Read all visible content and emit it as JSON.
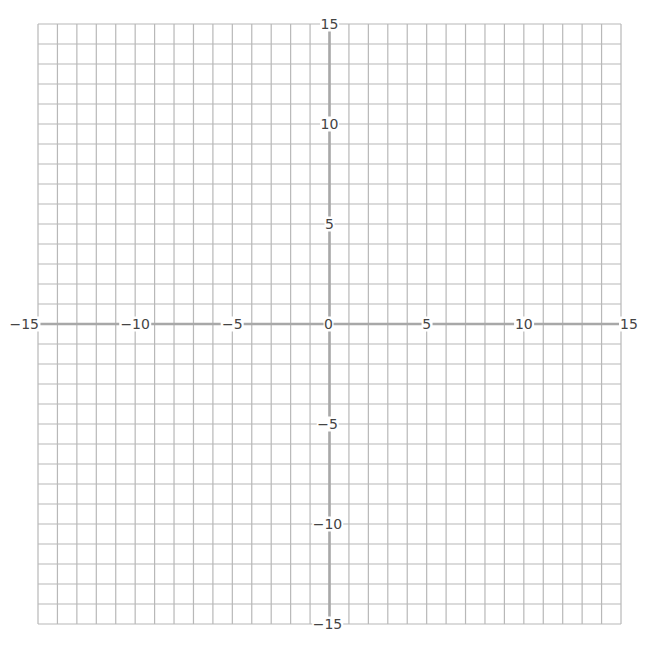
{
  "diagram": {
    "type": "coordinate-plane",
    "x_range": [
      -15,
      15
    ],
    "y_range": [
      -15,
      15
    ],
    "grid_step": 1,
    "label_step": 5,
    "x_axis_labels": [
      "−15",
      "−10",
      "−5",
      "0",
      "5",
      "10",
      "15"
    ],
    "y_axis_labels": [
      "15",
      "10",
      "5",
      "−5",
      "−10",
      "−15"
    ],
    "colors": {
      "grid": "#b8b8b8",
      "axis": "#a8a8a8",
      "label": "#444444",
      "background": "#ffffff"
    }
  }
}
